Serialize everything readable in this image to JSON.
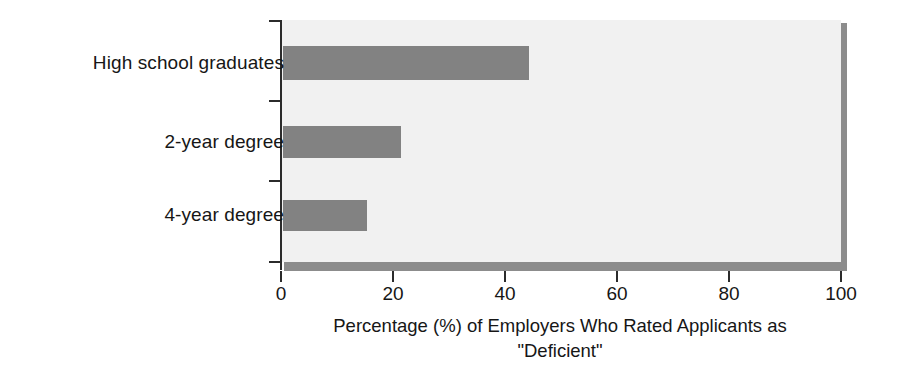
{
  "chart_data": {
    "type": "bar",
    "orientation": "horizontal",
    "title": "",
    "subtitle": "",
    "xlabel": "Percentage (%) of Employers Who Rated Applicants as \"Deficient\"",
    "xlabel_line1": "Percentage (%) of Employers Who Rated Applicants as",
    "xlabel_line2": "\"Deficient\"",
    "ylabel": "",
    "categories": [
      "High school graduates",
      "2-year degree",
      "4-year degree"
    ],
    "values": [
      44,
      21,
      15
    ],
    "series": [
      {
        "name": "Percentage of employers rating applicants deficient",
        "values": [
          44,
          21,
          15
        ]
      }
    ],
    "xlim": [
      0,
      100
    ],
    "x_ticks": [
      0,
      20,
      40,
      60,
      80,
      100
    ],
    "x_tick_labels": [
      "0",
      "20",
      "40",
      "60",
      "80",
      "100"
    ],
    "grid": false,
    "legend": false,
    "legend_position": "none",
    "bar_color": "#828282",
    "plot_background": "#f1f1f1",
    "axis_color": "#2b2b2b",
    "shadow_color": "#8c8c8c",
    "text_color": "#161616"
  }
}
